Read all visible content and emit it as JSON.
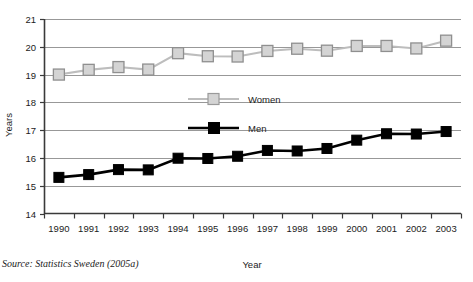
{
  "chart_data": {
    "type": "line",
    "title": "",
    "xlabel": "Year",
    "ylabel": "Years",
    "ylim": [
      14,
      21
    ],
    "yticks": [
      14,
      15,
      16,
      17,
      18,
      19,
      20,
      21
    ],
    "grid": true,
    "legend_position": "center-inside",
    "categories": [
      "1990",
      "1991",
      "1992",
      "1993",
      "1994",
      "1995",
      "1996",
      "1997",
      "1998",
      "1999",
      "2000",
      "2001",
      "2002",
      "2003"
    ],
    "series": [
      {
        "name": "Women",
        "color": "#bdbdbd",
        "marker": "open-square",
        "values": [
          19.0,
          19.17,
          19.27,
          19.18,
          19.77,
          19.66,
          19.65,
          19.85,
          19.93,
          19.86,
          20.03,
          20.03,
          19.94,
          20.22
        ]
      },
      {
        "name": "Men",
        "color": "#000000",
        "marker": "filled-square",
        "values": [
          15.3,
          15.4,
          15.58,
          15.57,
          15.99,
          15.98,
          16.06,
          16.27,
          16.25,
          16.34,
          16.64,
          16.87,
          16.86,
          16.95
        ]
      }
    ]
  },
  "axes": {
    "y_axis_title": "Years",
    "x_axis_title": "Year"
  },
  "legend": {
    "entries": [
      {
        "label": "Women"
      },
      {
        "label": "Men"
      }
    ]
  },
  "source": {
    "prefix": "Source:",
    "text": "Statistics Sweden (2005a)",
    "full": "Source: Statistics Sweden (2005a)"
  },
  "colors": {
    "women": "#bdbdbd",
    "men": "#000000",
    "gridline": "#8c8c8c",
    "axis": "#3a3a3a",
    "background": "#ffffff"
  }
}
